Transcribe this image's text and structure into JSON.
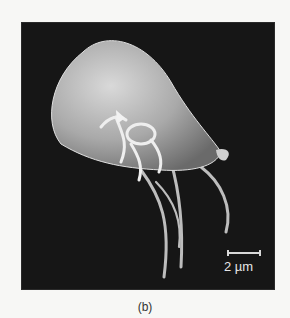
{
  "figure": {
    "scale_bar": {
      "label": "2 µm"
    },
    "panel_label": "(b)"
  }
}
